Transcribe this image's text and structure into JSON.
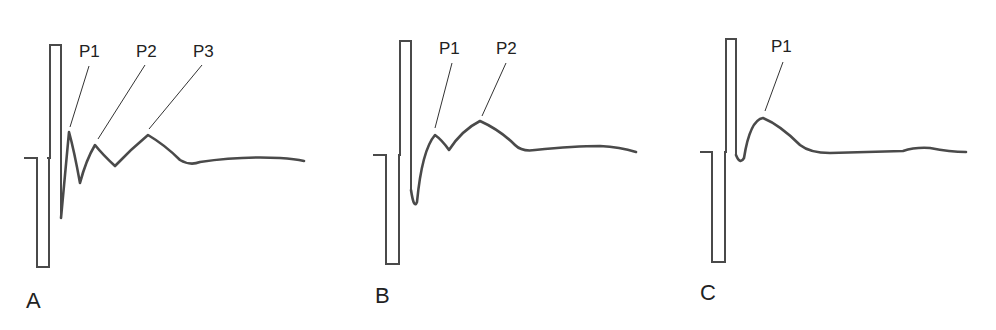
{
  "figure": {
    "panels": [
      {
        "id": "A",
        "label": "A",
        "peaks": [
          "P1",
          "P2",
          "P3"
        ]
      },
      {
        "id": "B",
        "label": "B",
        "peaks": [
          "P1",
          "P2"
        ]
      },
      {
        "id": "C",
        "label": "C",
        "peaks": [
          "P1"
        ]
      }
    ],
    "colors": {
      "trace": "#4a4a4a",
      "text": "#222222",
      "background": "#ffffff"
    }
  }
}
